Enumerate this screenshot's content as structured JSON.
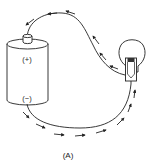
{
  "figure": {
    "label": "(A)"
  },
  "battery": {
    "positive_label": "(+)",
    "negative_label": "(−)"
  },
  "bulb": {
    "name": "light-bulb"
  },
  "wires": {
    "top_direction": "from bulb to positive terminal",
    "bottom_direction": "from negative terminal to bulb"
  },
  "colors": {
    "stroke": "#222222",
    "background": "#ffffff"
  }
}
